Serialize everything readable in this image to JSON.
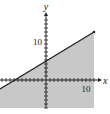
{
  "chart_data": {
    "type": "area",
    "title": "",
    "xlabel": "x",
    "ylabel": "y",
    "x_tick_label": "10",
    "y_tick_label": "10",
    "xlim": [
      -11.5,
      12
    ],
    "ylim": [
      -7,
      14
    ],
    "grid": false,
    "boundary_line": {
      "slope": 0.5,
      "intercept": 5,
      "style": "solid"
    },
    "line_points": [
      [
        -11.5,
        -0.75
      ],
      [
        12,
        11
      ]
    ],
    "shaded_region": "below line",
    "tick_spacing": 1,
    "colors": {
      "shade": "#c8c8c8",
      "line": "#222222",
      "axis": "#222222"
    }
  },
  "labels": {
    "x_axis": "x",
    "y_axis": "y",
    "x_ten": "10",
    "y_ten": "10"
  }
}
